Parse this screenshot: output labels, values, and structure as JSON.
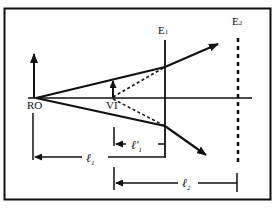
{
  "diagram": {
    "type": "optics-ray-diagram",
    "colors": {
      "stroke": "#111111",
      "background": "#ffffff"
    },
    "labels": {
      "real_object": "RO",
      "virtual_image": "VI",
      "eyepiece_1": "E",
      "eyepiece_1_sub": "1",
      "eyepiece_2": "E",
      "eyepiece_2_sub": "2",
      "l1": "ℓ",
      "l1_sub": "1",
      "l1_prime": "ℓ'",
      "l1_prime_sub": "1",
      "l2": "ℓ",
      "l2_sub": "2"
    },
    "elements": {
      "optical_axis": "horizontal line through RO",
      "E1": "solid vertical plane",
      "E2": "dashed vertical plane",
      "rays": [
        "upper ray RO→E1 then diverging up-right",
        "lower ray RO→E1 then diverging down-right"
      ],
      "virtual_rays": "dotted back-extensions from E1 to VI",
      "dimensions": [
        "ℓ1: RO to VI",
        "ℓ'1: VI to E1",
        "ℓ2: VI to E2"
      ]
    }
  }
}
